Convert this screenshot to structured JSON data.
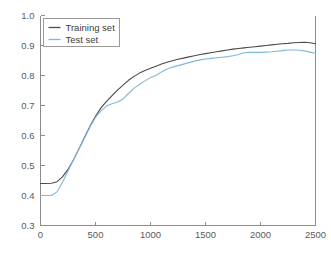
{
  "chart_data": {
    "type": "line",
    "title": "",
    "xlabel": "",
    "ylabel": "",
    "xlim": [
      0,
      2500
    ],
    "ylim": [
      0.3,
      1.0
    ],
    "grid": false,
    "legend_position": "top-left",
    "xticks": [
      0,
      500,
      1000,
      1500,
      2000,
      2500
    ],
    "xtick_labels": [
      "0",
      "500",
      "1000",
      "1500",
      "2000",
      "2500"
    ],
    "yticks": [
      0.3,
      0.4,
      0.5,
      0.6,
      0.7,
      0.8,
      0.9,
      1.0
    ],
    "ytick_labels": [
      "0.3",
      "0.4",
      "0.5",
      "0.6",
      "0.7",
      "0.8",
      "0.9",
      "1.0"
    ],
    "x": [
      0,
      50,
      100,
      150,
      200,
      250,
      300,
      350,
      400,
      450,
      500,
      550,
      600,
      650,
      700,
      750,
      800,
      850,
      900,
      950,
      1000,
      1050,
      1100,
      1150,
      1200,
      1250,
      1300,
      1350,
      1400,
      1450,
      1500,
      1550,
      1600,
      1650,
      1700,
      1750,
      1800,
      1850,
      1900,
      1950,
      2000,
      2050,
      2100,
      2150,
      2200,
      2250,
      2300,
      2350,
      2400,
      2450,
      2500
    ],
    "series": [
      {
        "name": "Training set",
        "color": "#4d4a48",
        "values": [
          0.44,
          0.44,
          0.441,
          0.446,
          0.462,
          0.487,
          0.519,
          0.556,
          0.594,
          0.631,
          0.664,
          0.692,
          0.714,
          0.733,
          0.751,
          0.768,
          0.784,
          0.797,
          0.808,
          0.817,
          0.824,
          0.831,
          0.838,
          0.844,
          0.849,
          0.854,
          0.858,
          0.862,
          0.866,
          0.87,
          0.873,
          0.876,
          0.879,
          0.882,
          0.885,
          0.888,
          0.89,
          0.892,
          0.894,
          0.896,
          0.898,
          0.9,
          0.902,
          0.904,
          0.906,
          0.907,
          0.909,
          0.91,
          0.911,
          0.909,
          0.906
        ]
      },
      {
        "name": "Test set",
        "color": "#7fb9da",
        "values": [
          0.4,
          0.4,
          0.4,
          0.412,
          0.444,
          0.482,
          0.519,
          0.556,
          0.592,
          0.628,
          0.66,
          0.682,
          0.698,
          0.706,
          0.712,
          0.722,
          0.74,
          0.758,
          0.77,
          0.782,
          0.793,
          0.8,
          0.812,
          0.822,
          0.828,
          0.833,
          0.838,
          0.843,
          0.848,
          0.852,
          0.855,
          0.857,
          0.859,
          0.861,
          0.863,
          0.866,
          0.87,
          0.876,
          0.877,
          0.877,
          0.877,
          0.878,
          0.879,
          0.881,
          0.883,
          0.885,
          0.885,
          0.884,
          0.882,
          0.878,
          0.874
        ]
      }
    ],
    "legend": [
      {
        "label": "Training set",
        "color": "#4d4a48"
      },
      {
        "label": "Test set",
        "color": "#7fb9da"
      }
    ]
  },
  "figure": {
    "background_color": "#ffffff",
    "axis_color": "#8c8c8c",
    "tick_label_color": "#5a5a5a"
  }
}
